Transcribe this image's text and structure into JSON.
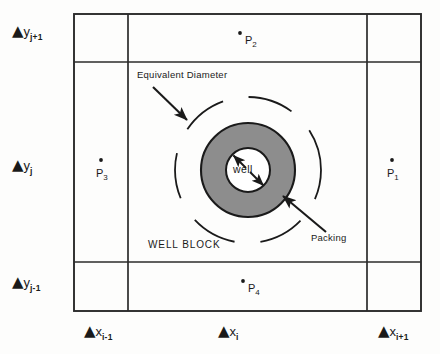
{
  "figure": {
    "name": "well-block-grid-diagram",
    "colors": {
      "background": "#fdfdfc",
      "grid_line": "#2b2b2b",
      "packing_fill": "#8d8d8d",
      "packing_stroke": "#1a1a1a",
      "well_fill": "#ffffff",
      "dashed_circle": "#1a1a1a",
      "text": "#1a1a1a"
    }
  },
  "axis_labels": {
    "y": [
      {
        "id": "dy-j-plus-1",
        "delta": "▲",
        "var": "y",
        "sub": "j+1"
      },
      {
        "id": "dy-j",
        "delta": "▲",
        "var": "y",
        "sub": "j"
      },
      {
        "id": "dy-j-minus-1",
        "delta": "▲",
        "var": "y",
        "sub": "j-1"
      }
    ],
    "x": [
      {
        "id": "dx-i-minus-1",
        "delta": "▲",
        "var": "x",
        "sub": "i-1"
      },
      {
        "id": "dx-i",
        "delta": "▲",
        "var": "x",
        "sub": "i"
      },
      {
        "id": "dx-i-plus-1",
        "delta": "▲",
        "var": "x",
        "sub": "i+1"
      }
    ]
  },
  "points": [
    {
      "id": "p1",
      "var": "P",
      "sub": "1"
    },
    {
      "id": "p2",
      "var": "P",
      "sub": "2"
    },
    {
      "id": "p3",
      "var": "P",
      "sub": "3"
    },
    {
      "id": "p4",
      "var": "P",
      "sub": "4"
    }
  ],
  "annotations": {
    "equivalent_diameter": "Equivalent Diameter",
    "packing": "Packing",
    "well": "well",
    "well_block": "WELL BLOCK"
  },
  "geometry": {
    "grid": {
      "left": 74,
      "right": 421,
      "top": 14,
      "bottom": 311,
      "v_inner_left": 128,
      "v_inner_right": 367,
      "h_inner_top": 62,
      "h_inner_bottom": 262
    },
    "well": {
      "center_x": 248,
      "center_y": 170,
      "packing_outer_radius": 47,
      "packing_inner_radius": 22,
      "equivalent_diameter_radius": 73
    }
  }
}
